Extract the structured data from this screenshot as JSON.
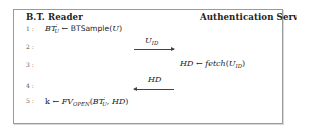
{
  "diagram": {
    "type": "protocol-sequence",
    "parties": {
      "left": "B.T. Reader",
      "right": "Authentication Server"
    },
    "line_numbers": [
      "1 :",
      "2 :",
      "3 :",
      "4 :",
      "5 :"
    ],
    "steps": [
      {
        "line": 1,
        "side": "left",
        "lhs": "BT",
        "lhs_sub": "U",
        "lhs_sup": "′",
        "op": "←",
        "func": "BTSample",
        "args_open": "(",
        "arg": "U",
        "args_close": ")"
      },
      {
        "line": 2,
        "direction": "left-to-right",
        "message": "U",
        "message_sub": "ID"
      },
      {
        "line": 3,
        "side": "right",
        "lhs": "HD",
        "op": "←",
        "func": "fetch",
        "args_open": "(",
        "arg": "U",
        "arg_sub": "ID",
        "args_close": ")"
      },
      {
        "line": 4,
        "direction": "right-to-left",
        "message": "HD"
      },
      {
        "line": 5,
        "side": "left",
        "lhs": "k",
        "op": "←",
        "func": "FV",
        "func_sub": "OPEN",
        "args_open": "(",
        "arg1": "BT",
        "arg1_sub": "U",
        "arg1_sup": "′",
        "sep": ", ",
        "arg2": "HD",
        "args_close": ")"
      }
    ]
  }
}
